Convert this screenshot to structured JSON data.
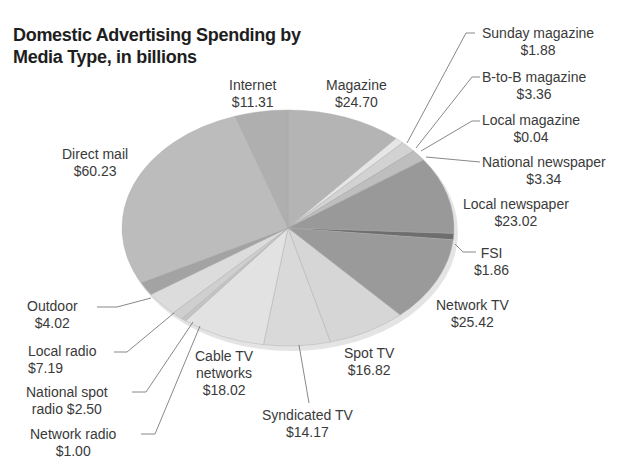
{
  "chart_data": {
    "type": "pie",
    "title": "Domestic Advertising Spending by Media Type, in billions",
    "title_lines": [
      "Domestic Advertising Spending by",
      "Media Type, in billions"
    ],
    "unit": "billions USD",
    "start_angle": "12 o'clock, clockwise",
    "slices": [
      {
        "label": "Magazine",
        "value": 24.7,
        "display": "$24.70",
        "color": "#b4b4b4"
      },
      {
        "label": "Sunday magazine",
        "value": 1.88,
        "display": "$1.88",
        "color": "#e6e6e6"
      },
      {
        "label": "B-to-B magazine",
        "value": 3.36,
        "display": "$3.36",
        "color": "#d2d2d2"
      },
      {
        "label": "Local magazine",
        "value": 0.04,
        "display": "$0.04",
        "color": "#c8c8c8"
      },
      {
        "label": "National newspaper",
        "value": 3.34,
        "display": "$3.34",
        "color": "#bebebe"
      },
      {
        "label": "Local newspaper",
        "value": 23.02,
        "display": "$23.02",
        "color": "#999999"
      },
      {
        "label": "FSI",
        "value": 1.86,
        "display": "$1.86",
        "color": "#6e6e6e"
      },
      {
        "label": "Network TV",
        "value": 25.42,
        "display": "$25.42",
        "color": "#9a9a9a"
      },
      {
        "label": "Spot TV",
        "value": 16.82,
        "display": "$16.82",
        "color": "#d6d6d6"
      },
      {
        "label": "Syndicated TV",
        "value": 14.17,
        "display": "$14.17",
        "color": "#d9d9d9"
      },
      {
        "label": "Cable TV networks",
        "value": 18.02,
        "display": "$18.02",
        "color": "#e2e2e2"
      },
      {
        "label": "Network radio",
        "value": 1.0,
        "display": "$1.00",
        "color": "#c4c4c4"
      },
      {
        "label": "National spot radio",
        "value": 2.5,
        "display": "$2.50",
        "color": "#cfcfcf"
      },
      {
        "label": "Local radio",
        "value": 7.19,
        "display": "$7.19",
        "color": "#dcdcdc"
      },
      {
        "label": "Outdoor",
        "value": 4.02,
        "display": "$4.02",
        "color": "#a3a3a3"
      },
      {
        "label": "Direct mail",
        "value": 60.23,
        "display": "$60.23",
        "color": "#bcbcbc"
      },
      {
        "label": "Internet",
        "value": 11.31,
        "display": "$11.31",
        "color": "#afafaf"
      }
    ]
  },
  "labels": {
    "internet": {
      "name": "Internet",
      "value": "$11.31"
    },
    "magazine": {
      "name": "Magazine",
      "value": "$24.70"
    },
    "direct_mail": {
      "name": "Direct mail",
      "value": "$60.23"
    },
    "sunday_magazine": {
      "name": "Sunday magazine",
      "value": "$1.88"
    },
    "btob_magazine": {
      "name": "B-to-B magazine",
      "value": "$3.36"
    },
    "local_magazine": {
      "name": "Local magazine",
      "value": "$0.04"
    },
    "national_newspaper": {
      "name": "National newspaper",
      "value": "$3.34"
    },
    "local_newspaper": {
      "name": "Local newspaper",
      "value": "$23.02"
    },
    "fsi": {
      "name": "FSI",
      "value": "$1.86"
    },
    "network_tv": {
      "name": "Network TV",
      "value": "$25.42"
    },
    "spot_tv": {
      "name": "Spot TV",
      "value": "$16.82"
    },
    "syndicated_tv": {
      "name": "Syndicated TV",
      "value": "$14.17"
    },
    "cable_tv": {
      "line1": "Cable TV",
      "line2": "networks",
      "value": "$18.02"
    },
    "network_radio": {
      "name": "Network radio",
      "value": "$1.00"
    },
    "national_spot_radio": {
      "line1": "National spot",
      "line2": "radio $2.50"
    },
    "local_radio": {
      "name": "Local radio",
      "value": "$7.19"
    },
    "outdoor": {
      "name": "Outdoor",
      "value": "$4.02"
    }
  }
}
